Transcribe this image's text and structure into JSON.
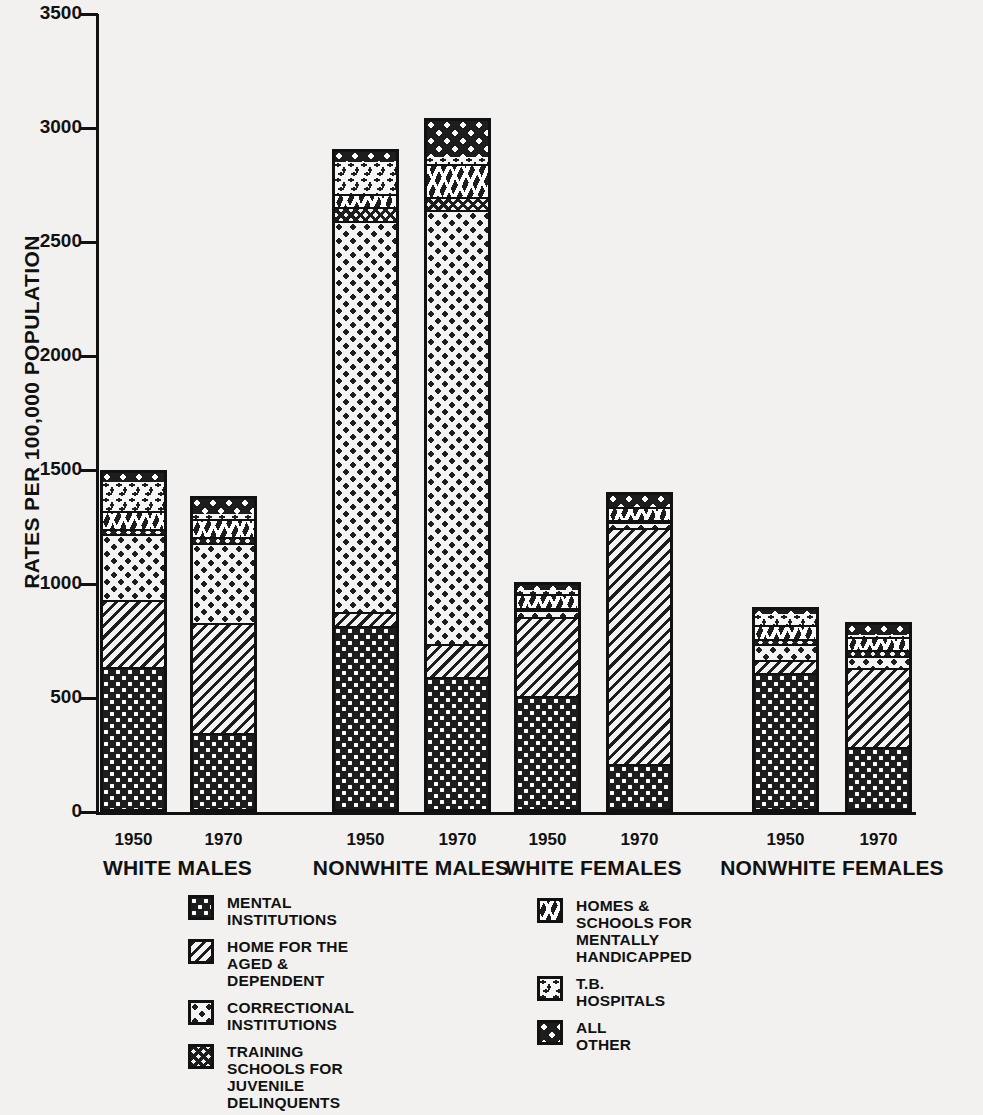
{
  "chart_data": {
    "type": "bar",
    "stacked": true,
    "title": "",
    "xlabel": "",
    "ylabel": "RATES PER 100,000 POPULATION",
    "ylim": [
      0,
      3500
    ],
    "yticks": [
      0,
      500,
      1000,
      1500,
      2000,
      2500,
      3000,
      3500
    ],
    "ytick_labels": [
      "0",
      "500",
      "1000",
      "1500",
      "2000",
      "2500",
      "3000",
      "3500"
    ],
    "grid": false,
    "legend_position": "below-axes",
    "groups": [
      "WHITE MALES",
      "NONWHITE MALES",
      "WHITE FEMALES",
      "NONWHITE FEMALES"
    ],
    "years": [
      "1950",
      "1970"
    ],
    "categories": [
      "WHITE MALES 1950",
      "WHITE MALES 1970",
      "NONWHITE MALES 1950",
      "NONWHITE MALES 1970",
      "WHITE FEMALES 1950",
      "WHITE FEMALES 1970",
      "NONWHITE FEMALES 1950",
      "NONWHITE FEMALES 1970"
    ],
    "series": [
      {
        "name": "MENTAL INSTITUTIONS",
        "pattern": "mental",
        "values": [
          640,
          350,
          820,
          595,
          515,
          215,
          615,
          290
        ]
      },
      {
        "name": "HOME FOR THE AGED & DEPENDENT",
        "pattern": "aged",
        "values": [
          295,
          485,
          60,
          145,
          345,
          1035,
          55,
          345
        ]
      },
      {
        "name": "CORRECTIONAL INSTITUTIONS",
        "pattern": "correctional",
        "values": [
          290,
          350,
          1715,
          1905,
          30,
          25,
          70,
          55
        ]
      },
      {
        "name": "TRAINING SCHOOLS FOR JUVENILE DELINQUENTS",
        "pattern": "training",
        "values": [
          20,
          25,
          65,
          55,
          10,
          10,
          25,
          25
        ]
      },
      {
        "name": "HOMES & SCHOOLS FOR MENTALLY HANDICAPPED",
        "pattern": "homes",
        "values": [
          80,
          80,
          55,
          145,
          60,
          55,
          60,
          55
        ]
      },
      {
        "name": "T.B. HOSPITALS",
        "pattern": "tb",
        "values": [
          135,
          30,
          150,
          40,
          25,
          10,
          55,
          20
        ]
      },
      {
        "name": "ALL OTHER",
        "pattern": "all",
        "values": [
          40,
          65,
          45,
          160,
          25,
          55,
          20,
          45
        ]
      }
    ],
    "totals": [
      1500,
      1385,
      2910,
      3045,
      1010,
      1405,
      900,
      835
    ],
    "units": "rates per 100,000 population"
  },
  "axis": {
    "y_label": "RATES PER 100,000 POPULATION",
    "y_ticks": [
      "3500",
      "3000",
      "2500",
      "2000",
      "1500",
      "1000",
      "500",
      "0"
    ]
  },
  "x_axis": {
    "years": [
      "1950",
      "1970",
      "1950",
      "1970",
      "1950",
      "1970",
      "1950",
      "1970"
    ],
    "groups": [
      "WHITE MALES",
      "NONWHITE MALES",
      "WHITE FEMALES",
      "NONWHITE FEMALES"
    ]
  },
  "legend": {
    "left_column": [
      {
        "label": "MENTAL\nINSTITUTIONS",
        "pattern": "mental"
      },
      {
        "label": "HOME FOR THE\nAGED & DEPENDENT",
        "pattern": "aged"
      },
      {
        "label": "CORRECTIONAL\nINSTITUTIONS",
        "pattern": "correctional"
      },
      {
        "label": "TRAINING SCHOOLS FOR\nJUVENILE DELINQUENTS",
        "pattern": "training"
      }
    ],
    "right_column": [
      {
        "label": "HOMES & SCHOOLS FOR\nMENTALLY HANDICAPPED",
        "pattern": "homes"
      },
      {
        "label": "T.B.\nHOSPITALS",
        "pattern": "tb"
      },
      {
        "label": "ALL\nOTHER",
        "pattern": "all"
      }
    ]
  },
  "colors": {
    "ink": "#111111",
    "paper": "#f2f1ef"
  }
}
